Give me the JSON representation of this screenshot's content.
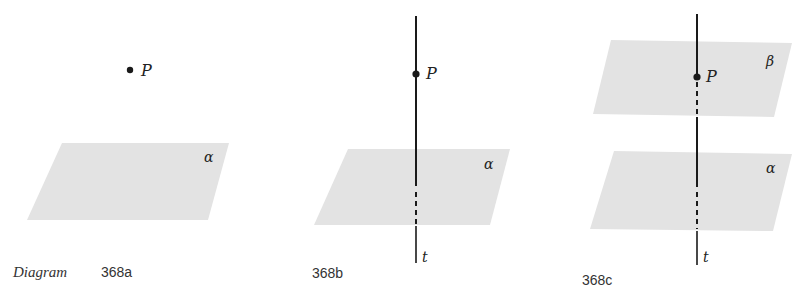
{
  "colors": {
    "plane_fill": "#e3e3e3",
    "line": "#1a1a1a",
    "text": "#222222"
  },
  "panels": [
    {
      "id": "368a",
      "caption_prefix": "Diagram",
      "caption_number": "368a",
      "point_label": "P",
      "plane_labels": [
        "α"
      ],
      "has_line": false
    },
    {
      "id": "368b",
      "caption_number": "368b",
      "point_label": "P",
      "plane_labels": [
        "α"
      ],
      "line_label": "t",
      "has_line": true
    },
    {
      "id": "368c",
      "caption_number": "368c",
      "point_label": "P",
      "plane_labels": [
        "β",
        "α"
      ],
      "line_label": "t",
      "has_line": true
    }
  ]
}
